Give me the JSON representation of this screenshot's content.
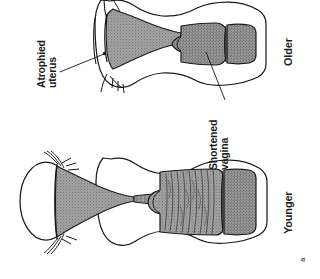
{
  "figure": {
    "part_label": "a",
    "background_color": "#ffffff",
    "ink_color": "#1a1a1a",
    "organ_fill_color": "#9a9a9a",
    "label_color": "#1c1c1c",
    "orientation_note": "labels rotated 90 degrees counter-clockwise"
  },
  "callouts": [
    {
      "id": "atrophied-uterus",
      "line1": "Atrophied",
      "line2": "uterus",
      "points_to": "older uterus"
    },
    {
      "id": "shortened-vagina",
      "line1": "Shortened",
      "line2": "vagina",
      "points_to": "older vagina"
    }
  ],
  "group_labels": [
    {
      "id": "older",
      "text": "Older"
    },
    {
      "id": "younger",
      "text": "Younger"
    }
  ]
}
